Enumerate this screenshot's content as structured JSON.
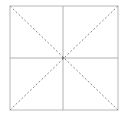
{
  "diagram": {
    "type": "square-grid-with-diagonals",
    "square": {
      "x": 10,
      "y": 6,
      "width": 108,
      "height": 104
    },
    "center": {
      "x": 63,
      "y": 58
    },
    "colors": {
      "frame": "#b8b8b8",
      "solid": "#b0b0b0",
      "dashed": "#8a8a8a",
      "background": "#ffffff"
    },
    "lines": [
      {
        "name": "vertical-midline",
        "style": "solid"
      },
      {
        "name": "horizontal-midline",
        "style": "solid"
      },
      {
        "name": "diagonal-top-left-to-bottom-right",
        "style": "dashed"
      },
      {
        "name": "diagonal-top-right-to-bottom-left",
        "style": "dashed"
      }
    ]
  }
}
